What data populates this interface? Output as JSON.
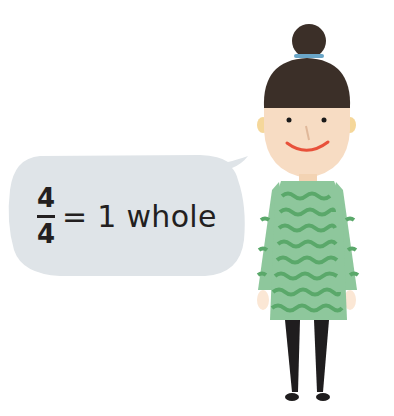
{
  "speech_bubble": {
    "numerator": "4",
    "denominator": "4",
    "equation_rest": "= 1 whole",
    "fill_color": "#dfe4e8"
  },
  "character": {
    "description": "girl with hair bun wearing green wavy-striped dress",
    "hair_color": "#3b2f28",
    "hair_tie_color": "#6aa6c8",
    "skin_color": "#f7dcc3",
    "dress_color": "#8ec79c",
    "dress_stripe_color": "#5aa86a",
    "legs_color": "#1f1d1e",
    "smile_color": "#e8513a"
  }
}
